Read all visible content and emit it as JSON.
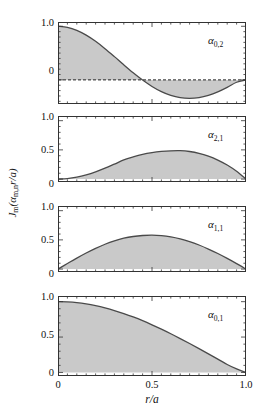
{
  "figure": {
    "background": "#ffffff",
    "axis_color": "#333333",
    "fill_color": "#c9c9c9",
    "curve_color": "#4a4a4a"
  },
  "axes": {
    "ylabel": "J",
    "ylabel_sub": "m",
    "ylabel_rest": "(α",
    "ylabel_sub2": "m,n",
    "ylabel_tail": "r/a)",
    "ylabel_full": "Jm(αm,n r/a)",
    "xlabel": "r/a",
    "xticks": [
      "0",
      "0.5",
      "1.0"
    ],
    "xtick_values": [
      0,
      0.5,
      1.0
    ],
    "xlim": [
      0,
      1
    ]
  },
  "chart_data": {
    "type": "line",
    "title": "",
    "xlabel": "r/a",
    "ylabel": "Jm(αm,n r/a)",
    "xlim": [
      0,
      1
    ],
    "grid": false,
    "legend": "none",
    "panels": [
      {
        "index": 0,
        "label_base": "α",
        "label_sub": "0,2",
        "m": 0,
        "n": 2,
        "alpha": 5.5201,
        "ylim": [
          -0.45,
          1.08
        ],
        "yticks": [
          1.0,
          0.0
        ],
        "ytick_labels": [
          "1.0",
          "0"
        ],
        "zero_line": true,
        "zero_line_style": "dashed",
        "x": [
          0.0,
          0.05,
          0.1,
          0.15,
          0.2,
          0.25,
          0.3,
          0.35,
          0.4,
          0.45,
          0.5,
          0.55,
          0.6,
          0.65,
          0.7,
          0.75,
          0.8,
          0.85,
          0.9,
          0.95,
          1.0
        ],
        "y": [
          1.0,
          0.981,
          0.925,
          0.836,
          0.72,
          0.583,
          0.434,
          0.281,
          0.133,
          -0.004,
          -0.123,
          -0.22,
          -0.291,
          -0.333,
          -0.346,
          -0.331,
          -0.289,
          -0.224,
          -0.14,
          -0.044,
          0.0
        ]
      },
      {
        "index": 1,
        "label_base": "α",
        "label_sub": "2,1",
        "m": 2,
        "n": 1,
        "alpha": 5.1356,
        "ylim": [
          -0.05,
          1.08
        ],
        "yticks": [
          1.0,
          0.5,
          0.0
        ],
        "ytick_labels": [
          "1.0",
          "0.5",
          "0"
        ],
        "zero_line": false,
        "peak_value": 0.486,
        "peak_x": 0.63,
        "x": [
          0.0,
          0.05,
          0.1,
          0.15,
          0.2,
          0.25,
          0.3,
          0.35,
          0.4,
          0.45,
          0.5,
          0.55,
          0.6,
          0.65,
          0.7,
          0.75,
          0.8,
          0.85,
          0.9,
          0.95,
          1.0
        ],
        "y": [
          0.0,
          0.008,
          0.032,
          0.071,
          0.123,
          0.186,
          0.256,
          0.328,
          0.38,
          0.423,
          0.453,
          0.473,
          0.484,
          0.486,
          0.472,
          0.441,
          0.392,
          0.325,
          0.24,
          0.133,
          0.0
        ]
      },
      {
        "index": 2,
        "label_base": "α",
        "label_sub": "1,1",
        "m": 1,
        "n": 1,
        "alpha": 3.8317,
        "ylim": [
          -0.05,
          1.08
        ],
        "yticks": [
          1.0,
          0.5,
          0.0
        ],
        "ytick_labels": [
          "1.0",
          "0.5",
          "0"
        ],
        "zero_line": false,
        "peak_value": 0.5819,
        "peak_x": 0.48,
        "x": [
          0.0,
          0.05,
          0.1,
          0.15,
          0.2,
          0.25,
          0.3,
          0.35,
          0.4,
          0.45,
          0.5,
          0.55,
          0.6,
          0.65,
          0.7,
          0.75,
          0.8,
          0.85,
          0.9,
          0.95,
          1.0
        ],
        "y": [
          0.0,
          0.095,
          0.188,
          0.275,
          0.355,
          0.425,
          0.483,
          0.528,
          0.558,
          0.575,
          0.581,
          0.573,
          0.552,
          0.518,
          0.471,
          0.412,
          0.343,
          0.266,
          0.183,
          0.094,
          0.0
        ]
      },
      {
        "index": 3,
        "label_base": "α",
        "label_sub": "0,1",
        "m": 0,
        "n": 1,
        "alpha": 2.4048,
        "ylim": [
          -0.05,
          1.08
        ],
        "yticks": [
          1.0,
          0.5,
          0.0
        ],
        "ytick_labels": [
          "1.0",
          "0.5",
          "0"
        ],
        "zero_line": false,
        "x": [
          0.0,
          0.05,
          0.1,
          0.15,
          0.2,
          0.25,
          0.3,
          0.35,
          0.4,
          0.45,
          0.5,
          0.55,
          0.6,
          0.65,
          0.7,
          0.75,
          0.8,
          0.85,
          0.9,
          0.95,
          1.0
        ],
        "y": [
          1.0,
          0.996,
          0.986,
          0.968,
          0.943,
          0.912,
          0.875,
          0.832,
          0.784,
          0.731,
          0.673,
          0.612,
          0.547,
          0.479,
          0.409,
          0.337,
          0.263,
          0.188,
          0.113,
          0.05,
          0.0
        ]
      }
    ]
  }
}
